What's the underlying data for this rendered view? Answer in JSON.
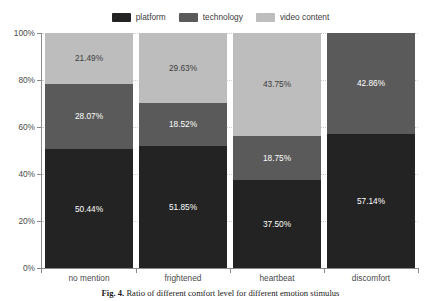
{
  "chart_data": {
    "type": "bar",
    "subtype": "stacked-100-percent",
    "title": "",
    "subtitle": "",
    "xlabel": "",
    "ylabel": "",
    "categories": [
      "no mention",
      "frightened",
      "heartbeat",
      "discomfort"
    ],
    "series": [
      {
        "name": "platform",
        "color": "#232323",
        "label_color": "#ffffff",
        "values": [
          50.44,
          51.85,
          37.5,
          57.14
        ],
        "labels": [
          "50.44%",
          "51.85%",
          "37.50%",
          "57.14%"
        ]
      },
      {
        "name": "technology",
        "color": "#5a5a5a",
        "label_color": "#ffffff",
        "values": [
          28.07,
          18.52,
          18.75,
          42.86
        ],
        "labels": [
          "28.07%",
          "18.52%",
          "18.75%",
          "42.86%"
        ]
      },
      {
        "name": "video content",
        "color": "#bdbdbd",
        "label_color": "#3c3c3c",
        "values": [
          21.49,
          29.63,
          43.75,
          0
        ],
        "labels": [
          "21.49%",
          "29.63%",
          "43.75%",
          ""
        ]
      }
    ],
    "ylim": [
      0,
      100
    ],
    "yticks": [
      0,
      20,
      40,
      60,
      80,
      100
    ],
    "ytick_labels": [
      "0%",
      "20%",
      "40%",
      "60%",
      "80%",
      "100%"
    ],
    "grid": true,
    "grid_style": "dotted-horizontal",
    "legend_position": "top-center",
    "legend_entries": [
      "platform",
      "technology",
      "video content"
    ]
  },
  "legend": {
    "items": [
      {
        "label": "platform"
      },
      {
        "label": "technology"
      },
      {
        "label": "video content"
      }
    ]
  },
  "caption": {
    "figure_number": "Fig. 4.",
    "text": "Ratio of different comfort level for different emotion stimulus"
  },
  "colors": {
    "platform": "#232323",
    "technology": "#5a5a5a",
    "video_content": "#bdbdbd",
    "axis": "#8a8a8a",
    "gridline": "#cfcfcf",
    "background": "#ffffff"
  }
}
